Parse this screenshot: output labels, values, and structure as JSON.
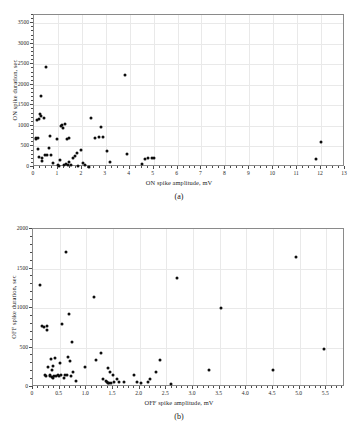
{
  "figure": {
    "panels": [
      {
        "id": "a",
        "caption": "(a)",
        "xlabel": "ON spike amplitude, mV",
        "ylabel": "ON spike duration, sec"
      },
      {
        "id": "b",
        "caption": "(b)",
        "xlabel": "OFF spike amplitude, mV",
        "ylabel": "OFF spike duration, sec"
      }
    ],
    "style": {
      "marker_color": "#0d0d0d",
      "grid_color": "#e9e9e9",
      "frame_color": "#8a8a8a",
      "background": "#ffffff"
    }
  },
  "chart_data": [
    {
      "type": "scatter",
      "panel": "a",
      "title": "(a)",
      "xlabel": "ON spike amplitude, mV",
      "ylabel": "ON spike duration, sec",
      "xlim": [
        0,
        13
      ],
      "ylim": [
        0,
        3700
      ],
      "xticks": [
        0,
        1,
        2,
        3,
        4,
        5,
        6,
        7,
        8,
        9,
        10,
        11,
        12,
        13
      ],
      "xticklabels": [
        "0",
        "1",
        "2",
        "3",
        "4",
        "5",
        "6",
        "7",
        "8",
        "9",
        "10",
        "11",
        "12",
        "13"
      ],
      "yticks": [
        0,
        500,
        1000,
        1500,
        2000,
        2500,
        3000,
        3500
      ],
      "yticklabels": [
        "0",
        "500",
        "1000",
        "1500",
        "2000",
        "2500",
        "3000",
        "3500"
      ],
      "xminor_step": 0.25,
      "yminor_step": 100,
      "grid": true,
      "legend": null,
      "points": [
        [
          0.08,
          700
        ],
        [
          0.1,
          690
        ],
        [
          0.12,
          1140
        ],
        [
          0.15,
          710
        ],
        [
          0.18,
          450
        ],
        [
          0.2,
          1170
        ],
        [
          0.22,
          250
        ],
        [
          0.25,
          1280
        ],
        [
          0.28,
          1250
        ],
        [
          0.3,
          1720
        ],
        [
          0.32,
          230
        ],
        [
          0.34,
          140
        ],
        [
          0.4,
          1190
        ],
        [
          0.45,
          300
        ],
        [
          0.5,
          2430
        ],
        [
          0.55,
          280
        ],
        [
          0.62,
          470
        ],
        [
          0.68,
          750
        ],
        [
          0.72,
          285
        ],
        [
          0.8,
          90
        ],
        [
          0.95,
          690
        ],
        [
          1.0,
          60
        ],
        [
          1.05,
          30
        ],
        [
          1.08,
          170
        ],
        [
          1.12,
          1000
        ],
        [
          1.18,
          1020
        ],
        [
          1.22,
          960
        ],
        [
          1.25,
          40
        ],
        [
          1.3,
          1050
        ],
        [
          1.33,
          70
        ],
        [
          1.38,
          685
        ],
        [
          1.42,
          60
        ],
        [
          1.45,
          700
        ],
        [
          1.48,
          120
        ],
        [
          1.55,
          45
        ],
        [
          1.62,
          230
        ],
        [
          1.7,
          270
        ],
        [
          1.78,
          330
        ],
        [
          1.85,
          20
        ],
        [
          1.95,
          410
        ],
        [
          2.05,
          100
        ],
        [
          2.15,
          60
        ],
        [
          2.3,
          10
        ],
        [
          2.38,
          1190
        ],
        [
          2.55,
          710
        ],
        [
          2.72,
          740
        ],
        [
          2.78,
          980
        ],
        [
          2.88,
          735
        ],
        [
          3.05,
          385
        ],
        [
          3.18,
          120
        ],
        [
          3.82,
          2230
        ],
        [
          3.88,
          310
        ],
        [
          4.5,
          85
        ],
        [
          4.62,
          200
        ],
        [
          4.78,
          215
        ],
        [
          4.95,
          225
        ],
        [
          5.02,
          220
        ],
        [
          11.8,
          200
        ],
        [
          11.98,
          620
        ]
      ]
    },
    {
      "type": "scatter",
      "panel": "b",
      "title": "(b)",
      "xlabel": "OFF spike amplitude, mV",
      "ylabel": "OFF spike duration, sec",
      "xlim": [
        0,
        5.85
      ],
      "ylim": [
        0,
        2000
      ],
      "xticks": [
        0,
        0.5,
        1.0,
        1.5,
        2.0,
        2.5,
        3.0,
        3.5,
        4.0,
        4.5,
        5.0,
        5.5
      ],
      "xticklabels": [
        "0",
        "0.5",
        "1.0",
        "1.5",
        "2.0",
        "2.5",
        "3.0",
        "3.5",
        "4.0",
        "4.5",
        "5.0",
        "5.5"
      ],
      "yticks": [
        0,
        500,
        1000,
        1500,
        2000
      ],
      "yticklabels": [
        "0",
        "500",
        "1000",
        "1500",
        "2000"
      ],
      "xminor_step": 0.1,
      "yminor_step": 100,
      "grid": true,
      "legend": null,
      "points": [
        [
          0.13,
          1290
        ],
        [
          0.17,
          770
        ],
        [
          0.2,
          765
        ],
        [
          0.22,
          150
        ],
        [
          0.24,
          140
        ],
        [
          0.26,
          775
        ],
        [
          0.27,
          720
        ],
        [
          0.29,
          255
        ],
        [
          0.31,
          145
        ],
        [
          0.32,
          150
        ],
        [
          0.33,
          355
        ],
        [
          0.35,
          130
        ],
        [
          0.36,
          215
        ],
        [
          0.37,
          115
        ],
        [
          0.38,
          260
        ],
        [
          0.4,
          145
        ],
        [
          0.42,
          370
        ],
        [
          0.44,
          140
        ],
        [
          0.46,
          150
        ],
        [
          0.48,
          145
        ],
        [
          0.5,
          310
        ],
        [
          0.52,
          150
        ],
        [
          0.55,
          800
        ],
        [
          0.58,
          120
        ],
        [
          0.6,
          150
        ],
        [
          0.62,
          1705
        ],
        [
          0.64,
          150
        ],
        [
          0.66,
          380
        ],
        [
          0.68,
          920
        ],
        [
          0.7,
          335
        ],
        [
          0.71,
          145
        ],
        [
          0.73,
          565
        ],
        [
          0.75,
          195
        ],
        [
          0.8,
          70
        ],
        [
          0.97,
          255
        ],
        [
          1.15,
          1145
        ],
        [
          1.18,
          345
        ],
        [
          1.28,
          425
        ],
        [
          1.32,
          95
        ],
        [
          1.37,
          80
        ],
        [
          1.39,
          60
        ],
        [
          1.4,
          50
        ],
        [
          1.41,
          235
        ],
        [
          1.43,
          55
        ],
        [
          1.45,
          195
        ],
        [
          1.47,
          50
        ],
        [
          1.5,
          150
        ],
        [
          1.52,
          60
        ],
        [
          1.58,
          95
        ],
        [
          1.62,
          60
        ],
        [
          1.7,
          65
        ],
        [
          1.9,
          150
        ],
        [
          1.95,
          60
        ],
        [
          2.02,
          55
        ],
        [
          2.15,
          60
        ],
        [
          2.2,
          95
        ],
        [
          2.3,
          195
        ],
        [
          2.38,
          345
        ],
        [
          2.58,
          40
        ],
        [
          2.7,
          1380
        ],
        [
          3.3,
          215
        ],
        [
          3.53,
          1000
        ],
        [
          4.5,
          220
        ],
        [
          4.93,
          1640
        ],
        [
          5.45,
          485
        ]
      ]
    }
  ]
}
